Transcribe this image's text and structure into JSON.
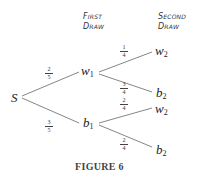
{
  "headers": {
    "first": [
      "First",
      "Draw"
    ],
    "second": [
      "Second",
      "Draw"
    ]
  },
  "nodes": {
    "root": {
      "label": "S",
      "sub": ""
    },
    "w1": {
      "label": "w",
      "sub": "1"
    },
    "b1": {
      "label": "b",
      "sub": "1"
    },
    "w1_w2": {
      "label": "w",
      "sub": "2"
    },
    "w1_b2": {
      "label": "b",
      "sub": "2"
    },
    "b1_w2": {
      "label": "w",
      "sub": "2"
    },
    "b1_b2": {
      "label": "b",
      "sub": "2"
    }
  },
  "edges": {
    "s_w1": {
      "num": "2",
      "den": "5"
    },
    "s_b1": {
      "num": "3",
      "den": "5"
    },
    "w1_w2": {
      "num": "1",
      "den": "4"
    },
    "w1_b2": {
      "num": "3",
      "den": "4"
    },
    "b1_w2": {
      "num": "2",
      "den": "4"
    },
    "b1_b2": {
      "num": "2",
      "den": "4"
    }
  },
  "caption": "FIGURE 6",
  "colors": {
    "line": "#666666",
    "text": "#222222"
  }
}
